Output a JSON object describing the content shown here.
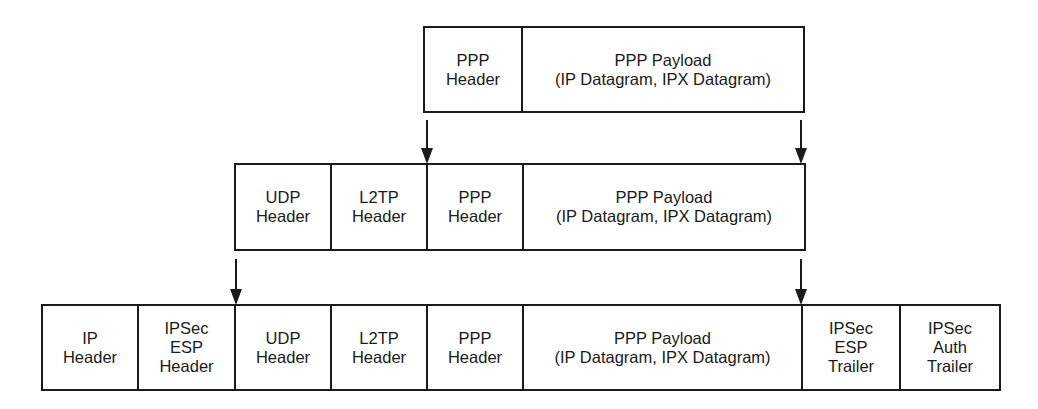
{
  "diagram": {
    "rows": [
      {
        "name": "ppp-frame",
        "cells": [
          {
            "label": "PPP\nHeader",
            "width": 98
          },
          {
            "label": "PPP Payload\n(IP Datagram, IPX Datagram)",
            "width": 280
          }
        ]
      },
      {
        "name": "l2tp-packet",
        "cells": [
          {
            "label": "UDP\nHeader",
            "width": 96
          },
          {
            "label": "L2TP\nHeader",
            "width": 96
          },
          {
            "label": "PPP\nHeader",
            "width": 96
          },
          {
            "label": "PPP Payload\n(IP Datagram, IPX Datagram)",
            "width": 280
          }
        ]
      },
      {
        "name": "ipsec-packet",
        "cells": [
          {
            "label": "IP\nHeader",
            "width": 96
          },
          {
            "label": "IPSec\nESP\nHeader",
            "width": 97
          },
          {
            "label": "UDP\nHeader",
            "width": 96
          },
          {
            "label": "L2TP\nHeader",
            "width": 96
          },
          {
            "label": "PPP\nHeader",
            "width": 96
          },
          {
            "label": "PPP Payload\n(IP Datagram, IPX Datagram)",
            "width": 279
          },
          {
            "label": "IPSec\nESP\nTrailer",
            "width": 98
          },
          {
            "label": "IPSec\nAuth\nTrailer",
            "width": 98
          }
        ]
      }
    ],
    "arrows": [
      {
        "x": 427,
        "y1": 120,
        "y2": 164
      },
      {
        "x": 801,
        "y1": 120,
        "y2": 164
      },
      {
        "x": 236,
        "y1": 259,
        "y2": 305
      },
      {
        "x": 801,
        "y1": 259,
        "y2": 305
      }
    ]
  }
}
